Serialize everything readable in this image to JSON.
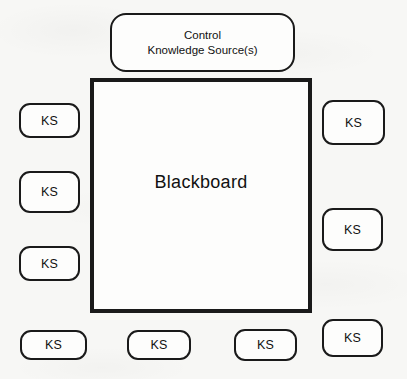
{
  "diagram": {
    "title_text_visible": false,
    "background_color": "#f7f7f5",
    "line_color": "#1a1a1a",
    "control": {
      "line1": "Control",
      "line2": "Knowledge Source(s)"
    },
    "blackboard": {
      "label": "Blackboard"
    },
    "knowledge_sources": {
      "left": [
        {
          "label": "KS"
        },
        {
          "label": "KS"
        },
        {
          "label": "KS"
        }
      ],
      "right": [
        {
          "label": "KS"
        },
        {
          "label": "KS"
        }
      ],
      "bottom": [
        {
          "label": "KS"
        },
        {
          "label": "KS"
        },
        {
          "label": "KS"
        },
        {
          "label": "KS"
        }
      ]
    }
  }
}
